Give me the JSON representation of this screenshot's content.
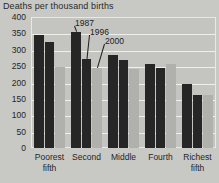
{
  "chart_data": {
    "type": "bar",
    "title": "Deaths per thousand births",
    "xlabel": "",
    "ylabel": "",
    "ylim": [
      0,
      400
    ],
    "yticks": [
      400,
      350,
      300,
      250,
      200,
      150,
      100,
      50,
      0
    ],
    "grid": true,
    "legend_position": "annotations-on-plot",
    "categories": [
      "Poorest fifth",
      "Second",
      "Middle",
      "Fourth",
      "Richest fifth"
    ],
    "category_lines": [
      [
        "Poorest",
        "fifth"
      ],
      [
        "Second",
        ""
      ],
      [
        "Middle",
        ""
      ],
      [
        "Fourth",
        ""
      ],
      [
        "Richest",
        "fifth"
      ]
    ],
    "series": [
      {
        "name": "1987",
        "color": "#262626",
        "values": [
          345,
          355,
          285,
          258,
          196
        ]
      },
      {
        "name": "1996",
        "color": "#262626",
        "values": [
          323,
          272,
          268,
          245,
          163
        ]
      },
      {
        "name": "2000",
        "color": "#b0b0ac",
        "values": [
          247,
          243,
          240,
          258,
          163
        ]
      }
    ],
    "annotations": [
      {
        "text": "1987",
        "target_series": "1987",
        "target_category": "Second"
      },
      {
        "text": "1996",
        "target_series": "1996",
        "target_category": "Second"
      },
      {
        "text": "2000",
        "target_series": "2000",
        "target_category": "Second"
      }
    ]
  },
  "colors": {
    "background": "#c8c8c4",
    "plot_background": "#c4c4c0",
    "gridline": "#efefec",
    "dark_bar": "#262626",
    "light_bar": "#b0b0ac",
    "text": "#262626"
  }
}
